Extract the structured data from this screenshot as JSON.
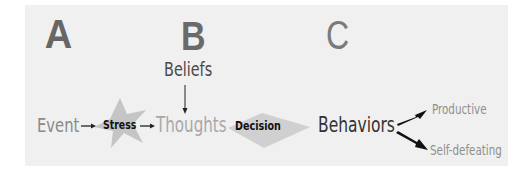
{
  "diagram": {
    "columns": [
      {
        "letter": "A"
      },
      {
        "letter": "B"
      },
      {
        "letter": "C"
      }
    ],
    "nodes": {
      "beliefs": "Beliefs",
      "event": "Event",
      "stress": "Stress",
      "thoughts": "Thoughts",
      "decision": "Decision",
      "behaviors": "Behaviors",
      "productive": "Productive",
      "self_defeating": "Self-defeating"
    },
    "edges": [
      {
        "from": "Event",
        "to": "Stress"
      },
      {
        "from": "Stress",
        "to": "Thoughts"
      },
      {
        "from": "Beliefs",
        "to": "Thoughts"
      },
      {
        "from": "Thoughts",
        "to": "Decision"
      },
      {
        "from": "Decision",
        "to": "Behaviors"
      },
      {
        "from": "Behaviors",
        "to": "Productive"
      },
      {
        "from": "Behaviors",
        "to": "Self-defeating"
      }
    ],
    "colors": {
      "panel": "#f0f0f0",
      "star": "#b8b8b8",
      "chevron": "#c8c8c8",
      "arrow": "#111111"
    }
  }
}
